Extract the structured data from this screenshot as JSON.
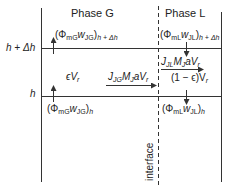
{
  "phases": {
    "gas": "Phase G",
    "liquid": "Phase L"
  },
  "levels": {
    "upper": "h + Δh",
    "lower": "h"
  },
  "interface_label": "interface",
  "fluxes": {
    "gas_upper": {
      "base": "(Φ",
      "sub1": "mG",
      "var": "w",
      "sub2": "JG",
      "close": ")",
      "sub3": "h + Δh"
    },
    "liquid_upper": {
      "base": "(Φ",
      "sub1": "mL",
      "var": "w",
      "sub2": "JL",
      "close": ")",
      "sub3": "h + Δh"
    },
    "gas_lower": {
      "base": "(Φ",
      "sub1": "mG",
      "var": "w",
      "sub2": "JG",
      "close": ")",
      "sub3": "h"
    },
    "liquid_lower": {
      "base": "(Φ",
      "sub1": "mL",
      "var": "w",
      "sub2": "JL",
      "close": ")",
      "sub3": "h"
    }
  },
  "volumes": {
    "gas": "ϵV",
    "gas_sub": "r",
    "liquid": "(1 − ϵ)V",
    "liquid_sub": "r"
  },
  "transfer": {
    "gas": {
      "J": "J",
      "Jsub": "JG",
      "M": "M",
      "Msub": "J",
      "rest": "aV",
      "rsub": "r"
    },
    "liquid": {
      "J": "J",
      "Jsub": "JL",
      "M": "M",
      "Msub": "J",
      "rest": "aV",
      "rsub": "r"
    }
  },
  "colors": {
    "line": "#333333",
    "background": "#ffffff"
  }
}
